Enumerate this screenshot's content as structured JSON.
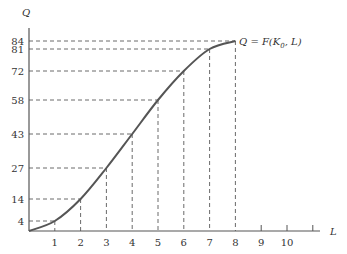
{
  "chart_data": {
    "type": "line",
    "title": "",
    "xlabel": "L",
    "ylabel": "Q",
    "curve_label": "Q = F(K",
    "curve_label_sub": "0",
    "curve_label_end": ", L)",
    "x": [
      0,
      1,
      2,
      3,
      4,
      5,
      6,
      7,
      8
    ],
    "values": [
      0,
      4,
      14,
      27,
      43,
      58,
      72,
      81,
      84
    ],
    "x_ticks": [
      "1",
      "2",
      "3",
      "4",
      "5",
      "6",
      "7",
      "8",
      "9",
      "10"
    ],
    "y_ticks": [
      "4",
      "14",
      "27",
      "43",
      "58",
      "72",
      "81",
      "84"
    ],
    "xlim": [
      0,
      11.5
    ],
    "ylim": [
      0,
      95
    ],
    "grid": false,
    "dashed_guides": true
  }
}
